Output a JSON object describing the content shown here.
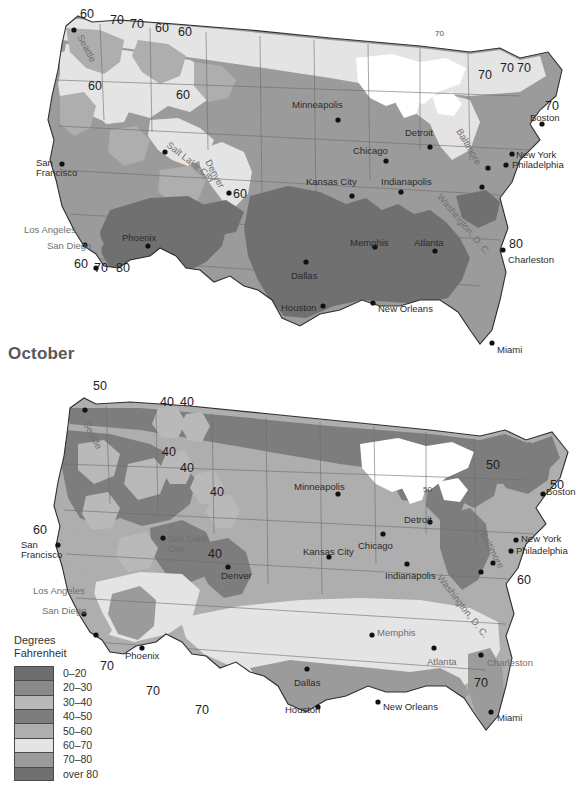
{
  "page": {
    "width": 582,
    "height": 792,
    "background": "#ffffff"
  },
  "sections": [
    {
      "id": "july",
      "title": ""
    },
    {
      "id": "october",
      "title": "October"
    }
  ],
  "legend": {
    "title_line1": "Degrees",
    "title_line2": "Fahrenheit",
    "items": [
      {
        "label": "0–20",
        "color": "#6e6e6e"
      },
      {
        "label": "20–30",
        "color": "#8a8a8a"
      },
      {
        "label": "30–40",
        "color": "#b9b9b9"
      },
      {
        "label": "40–50",
        "color": "#7d7d7d"
      },
      {
        "label": "50–60",
        "color": "#aeaeae"
      },
      {
        "label": "60–70",
        "color": "#e4e4e4"
      },
      {
        "label": "70–80",
        "color": "#9b9b9b"
      },
      {
        "label": "over 80",
        "color": "#707070"
      }
    ]
  },
  "map_july": {
    "name": "july-temperature-map",
    "cities": [
      {
        "name": "Seattle",
        "x": 84,
        "y": 33,
        "rot": 62,
        "dotx": 74,
        "doty": 30,
        "dim": true
      },
      {
        "name": "San\nFrancisco",
        "x": 36,
        "y": 158,
        "dotx": 62,
        "doty": 164,
        "anchor": "right",
        "dim": false
      },
      {
        "name": "Los Angeles",
        "x": 24,
        "y": 225,
        "dotx": 85,
        "doty": 245,
        "anchor": "right",
        "dim": true
      },
      {
        "name": "San Diego",
        "x": 47,
        "y": 241,
        "dotx": 96,
        "doty": 268,
        "anchor": "right",
        "dim": true
      },
      {
        "name": "Phoenix",
        "x": 122,
        "y": 233,
        "dotx": 148,
        "doty": 246,
        "dim": false
      },
      {
        "name": "Salt Lake City",
        "x": 171,
        "y": 140,
        "rot": 38,
        "dotx": 165,
        "doty": 152,
        "dim": true
      },
      {
        "name": "Denver",
        "x": 212,
        "y": 158,
        "rot": 62,
        "dotx": 229,
        "doty": 193,
        "dim": true
      },
      {
        "name": "Minneapolis",
        "x": 292,
        "y": 100,
        "dotx": 338,
        "doty": 120,
        "dim": false
      },
      {
        "name": "Kansas City",
        "x": 306,
        "y": 177,
        "dotx": 352,
        "doty": 196,
        "dim": false
      },
      {
        "name": "Chicago",
        "x": 353,
        "y": 146,
        "dotx": 386,
        "doty": 161,
        "dim": false
      },
      {
        "name": "Detroit",
        "x": 405,
        "y": 128,
        "dotx": 430,
        "doty": 147,
        "dim": false
      },
      {
        "name": "Indianapolis",
        "x": 381,
        "y": 177,
        "dotx": 401,
        "doty": 192,
        "dim": false
      },
      {
        "name": "Memphis",
        "x": 350,
        "y": 238,
        "dotx": 375,
        "doty": 247,
        "dim": false
      },
      {
        "name": "Atlanta",
        "x": 414,
        "y": 238,
        "dotx": 435,
        "doty": 251,
        "dim": false
      },
      {
        "name": "Dallas",
        "x": 291,
        "y": 271,
        "dotx": 306,
        "doty": 262,
        "dim": false
      },
      {
        "name": "Houston",
        "x": 281,
        "y": 303,
        "dotx": 323,
        "doty": 306,
        "dim": false
      },
      {
        "name": "New Orleans",
        "x": 378,
        "y": 304,
        "dotx": 373,
        "doty": 303,
        "dim": false
      },
      {
        "name": "Miami",
        "x": 497,
        "y": 345,
        "dotx": 492,
        "doty": 343,
        "dim": false
      },
      {
        "name": "Charleston",
        "x": 508,
        "y": 255,
        "dotx": 503,
        "doty": 250,
        "dim": false
      },
      {
        "name": "Washington, D. C.",
        "x": 443,
        "y": 192,
        "rot": 50,
        "dotx": 482,
        "doty": 187,
        "dim": true
      },
      {
        "name": "Baltimore",
        "x": 463,
        "y": 127,
        "rot": 60,
        "dotx": 488,
        "doty": 168,
        "dim": true
      },
      {
        "name": "New York",
        "x": 516,
        "y": 150,
        "dotx": 512,
        "doty": 154,
        "dim": false
      },
      {
        "name": "Philadelphia",
        "x": 512,
        "y": 160,
        "dotx": 506,
        "doty": 165,
        "dim": false
      },
      {
        "name": "Boston",
        "x": 530,
        "y": 113,
        "dotx": 542,
        "doty": 124,
        "dim": false
      }
    ],
    "contour_labels": [
      {
        "value": "60",
        "x": 80,
        "y": 8
      },
      {
        "value": "70",
        "x": 110,
        "y": 14
      },
      {
        "value": "70",
        "x": 130,
        "y": 18
      },
      {
        "value": "60",
        "x": 155,
        "y": 22
      },
      {
        "value": "60",
        "x": 178,
        "y": 26
      },
      {
        "value": "60",
        "x": 88,
        "y": 80
      },
      {
        "value": "60",
        "x": 176,
        "y": 89
      },
      {
        "value": "60",
        "x": 233,
        "y": 188
      },
      {
        "value": "60",
        "x": 74,
        "y": 258
      },
      {
        "value": "70",
        "x": 94,
        "y": 262
      },
      {
        "value": "80",
        "x": 116,
        "y": 262
      },
      {
        "value": "70",
        "x": 435,
        "y": 30,
        "size": "sm"
      },
      {
        "value": "70",
        "x": 478,
        "y": 69
      },
      {
        "value": "70",
        "x": 500,
        "y": 62
      },
      {
        "value": "70",
        "x": 517,
        "y": 62
      },
      {
        "value": "70",
        "x": 545,
        "y": 100
      },
      {
        "value": "80",
        "x": 509,
        "y": 238
      }
    ]
  },
  "map_october": {
    "name": "october-temperature-map",
    "cities": [
      {
        "name": "Seattle",
        "x": 90,
        "y": 420,
        "rot": 62,
        "dotx": 85,
        "doty": 410,
        "dim": true
      },
      {
        "name": "San\nFrancisco",
        "x": 21,
        "y": 540,
        "dotx": 58,
        "doty": 545,
        "anchor": "left",
        "dim": false
      },
      {
        "name": "Los Angeles",
        "x": 33,
        "y": 586,
        "dotx": 84,
        "doty": 614,
        "anchor": "left",
        "dim": true
      },
      {
        "name": "San Diego",
        "x": 42,
        "y": 606,
        "dotx": 96,
        "doty": 635,
        "anchor": "left",
        "dim": true
      },
      {
        "name": "Phoenix",
        "x": 125,
        "y": 651,
        "dotx": 142,
        "doty": 648,
        "dim": false
      },
      {
        "name": "Salt Lake\nCity",
        "x": 168,
        "y": 534,
        "dotx": 163,
        "doty": 538,
        "dim": true
      },
      {
        "name": "Denver",
        "x": 221,
        "y": 571,
        "dotx": 228,
        "doty": 567,
        "dim": false
      },
      {
        "name": "Minneapolis",
        "x": 294,
        "y": 482,
        "dotx": 338,
        "doty": 494,
        "dim": false
      },
      {
        "name": "Kansas City",
        "x": 303,
        "y": 547,
        "dotx": 329,
        "doty": 557,
        "dim": false
      },
      {
        "name": "Chicago",
        "x": 358,
        "y": 541,
        "dotx": 383,
        "doty": 534,
        "dim": false
      },
      {
        "name": "Detroit",
        "x": 404,
        "y": 515,
        "dotx": 430,
        "doty": 522,
        "dim": false
      },
      {
        "name": "Indianapolis",
        "x": 385,
        "y": 571,
        "dotx": 407,
        "doty": 564,
        "dim": false
      },
      {
        "name": "Memphis",
        "x": 377,
        "y": 628,
        "dotx": 372,
        "doty": 635,
        "dim": true
      },
      {
        "name": "Atlanta",
        "x": 427,
        "y": 657,
        "dotx": 434,
        "doty": 648,
        "dim": true
      },
      {
        "name": "Dallas",
        "x": 294,
        "y": 678,
        "dotx": 307,
        "doty": 669,
        "dim": false
      },
      {
        "name": "Houston",
        "x": 285,
        "y": 705,
        "dotx": 318,
        "doty": 707,
        "dim": false
      },
      {
        "name": "New Orleans",
        "x": 383,
        "y": 702,
        "dotx": 378,
        "doty": 702,
        "dim": false
      },
      {
        "name": "Miami",
        "x": 497,
        "y": 713,
        "dotx": 491,
        "doty": 712,
        "dim": false
      },
      {
        "name": "Charleston",
        "x": 487,
        "y": 658,
        "dotx": 481,
        "doty": 655,
        "dim": true
      },
      {
        "name": "Washington, D. C.",
        "x": 443,
        "y": 573,
        "rot": 52,
        "dotx": 481,
        "doty": 572,
        "dim": true
      },
      {
        "name": "Baltimore",
        "x": 487,
        "y": 530,
        "rot": 62,
        "dotx": 493,
        "doty": 563,
        "dim": true
      },
      {
        "name": "New York",
        "x": 521,
        "y": 534,
        "dotx": 516,
        "doty": 540,
        "dim": false
      },
      {
        "name": "Philadelphia",
        "x": 516,
        "y": 546,
        "dotx": 511,
        "doty": 551,
        "dim": false
      },
      {
        "name": "Boston",
        "x": 546,
        "y": 487,
        "dotx": 543,
        "doty": 494,
        "dim": false
      }
    ],
    "contour_labels": [
      {
        "value": "50",
        "x": 93,
        "y": 380
      },
      {
        "value": "40",
        "x": 160,
        "y": 396
      },
      {
        "value": "40",
        "x": 180,
        "y": 396
      },
      {
        "value": "40",
        "x": 162,
        "y": 446
      },
      {
        "value": "40",
        "x": 180,
        "y": 462
      },
      {
        "value": "40",
        "x": 210,
        "y": 486
      },
      {
        "value": "40",
        "x": 208,
        "y": 548
      },
      {
        "value": "60",
        "x": 33,
        "y": 524
      },
      {
        "value": "70",
        "x": 100,
        "y": 660
      },
      {
        "value": "70",
        "x": 146,
        "y": 685
      },
      {
        "value": "70",
        "x": 195,
        "y": 704
      },
      {
        "value": "50",
        "x": 423,
        "y": 486,
        "size": "sm"
      },
      {
        "value": "50",
        "x": 486,
        "y": 459
      },
      {
        "value": "50",
        "x": 550,
        "y": 479
      },
      {
        "value": "60",
        "x": 517,
        "y": 574
      },
      {
        "value": "70",
        "x": 474,
        "y": 677
      }
    ]
  }
}
